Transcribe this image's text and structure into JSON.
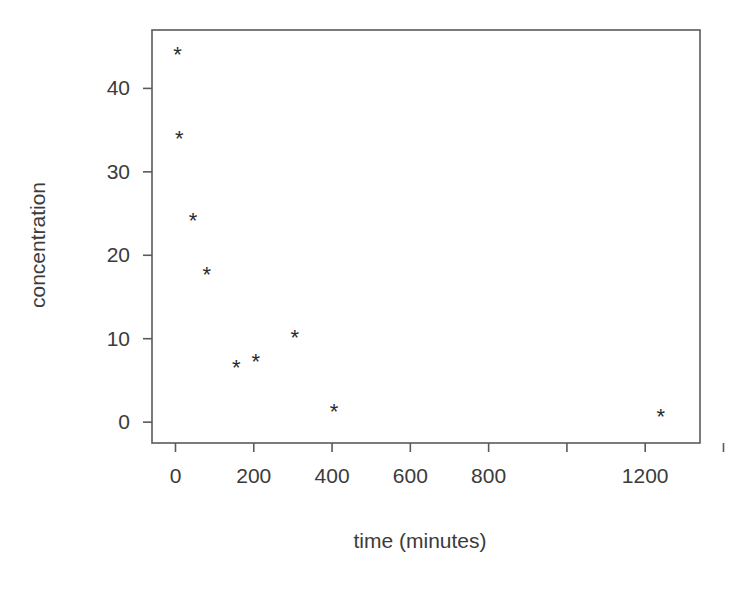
{
  "chart_data": {
    "type": "scatter",
    "title": "",
    "xlabel": "time (minutes)",
    "ylabel": "concentration",
    "xlim": [
      -60,
      1340
    ],
    "ylim": [
      -2.5,
      47
    ],
    "grid": false,
    "legend": null,
    "marker": "*",
    "marker_color": "#2b2b2b",
    "xticks": [
      0,
      200,
      400,
      600,
      800,
      1000,
      1200,
      1400
    ],
    "xticklabels": [
      "0",
      "200",
      "400",
      "600",
      "800",
      "",
      "1200",
      ""
    ],
    "yticks": [
      0,
      10,
      20,
      30,
      40
    ],
    "yticklabels": [
      "0",
      "10",
      "20",
      "30",
      "40"
    ],
    "x": [
      5,
      10,
      45,
      80,
      155,
      205,
      305,
      405,
      1240
    ],
    "y": [
      44.1,
      34.0,
      24.2,
      17.7,
      6.5,
      7.3,
      10.2,
      1.3,
      0.7
    ],
    "points": [
      {
        "x": 5,
        "y": 44.1
      },
      {
        "x": 10,
        "y": 34.0
      },
      {
        "x": 45,
        "y": 24.2
      },
      {
        "x": 80,
        "y": 17.7
      },
      {
        "x": 155,
        "y": 6.5
      },
      {
        "x": 205,
        "y": 7.3
      },
      {
        "x": 305,
        "y": 10.2
      },
      {
        "x": 405,
        "y": 1.3
      },
      {
        "x": 1240,
        "y": 0.7
      }
    ]
  }
}
